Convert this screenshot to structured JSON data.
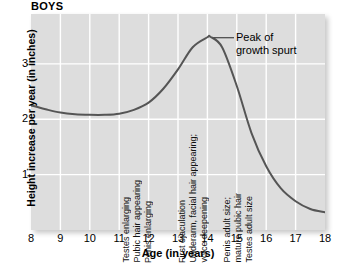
{
  "chart_data": {
    "type": "line",
    "title": "BOYS",
    "xlabel": "Age (in years)",
    "ylabel": "Height increase per year (in inches)",
    "xlim": [
      8,
      18
    ],
    "ylim": [
      0,
      3.9
    ],
    "xticks": [
      8,
      9,
      10,
      11,
      12,
      13,
      14,
      15,
      16,
      17,
      18
    ],
    "yticks": [
      1,
      2,
      3
    ],
    "grid": true,
    "legend": "none",
    "series": [
      {
        "name": "Height increase per year",
        "x": [
          8,
          8.5,
          9,
          9.5,
          10,
          10.5,
          11,
          11.5,
          12,
          12.5,
          13,
          13.5,
          14,
          14.1,
          14.5,
          15,
          15.5,
          16,
          16.5,
          17,
          17.5,
          18
        ],
        "values": [
          2.25,
          2.18,
          2.12,
          2.09,
          2.08,
          2.08,
          2.1,
          2.17,
          2.3,
          2.55,
          2.9,
          3.3,
          3.48,
          3.49,
          3.3,
          2.6,
          1.75,
          1.15,
          0.75,
          0.52,
          0.38,
          0.32
        ]
      }
    ],
    "annotations": [
      {
        "name": "peak-callout",
        "label_line_1": "Peak of",
        "label_line_2": "growth spurt",
        "points_to_x": 14.1,
        "points_to_y": 3.49
      },
      {
        "name": "event-group-early",
        "at_age_range": "11.0-12.2",
        "lines": [
          "Testes enlarging",
          "Pubic hair appearing",
          "Penis enlarging"
        ]
      },
      {
        "name": "event-group-mid",
        "at_age_range": "12.9-14.2",
        "lines": [
          "First ejaculation",
          "Underarm, facial hair appearing;",
          "voice deepening"
        ]
      },
      {
        "name": "event-group-late",
        "at_age_range": "14.5-15.6",
        "lines": [
          "Penis adult size;",
          "mature pubic hair",
          "Testes adult size"
        ]
      }
    ],
    "colors": {
      "plot_background": "#dddddd",
      "gridline": "#ffffff",
      "curve": "#555555",
      "text": "#000000"
    }
  }
}
